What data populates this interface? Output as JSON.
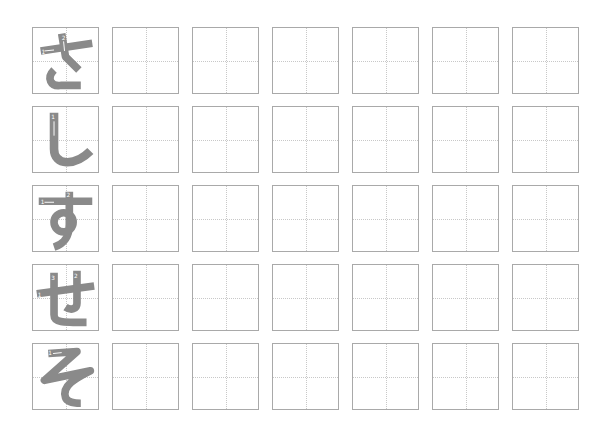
{
  "worksheet": {
    "title": "Hiragana writing practice",
    "stroke_color": "#8a8a8a",
    "grid_line_color": "#c8c8c8",
    "box_border_color": "#a9a9a9",
    "practice_boxes_per_row": 6,
    "rows": [
      {
        "character": "さ",
        "romaji": "sa",
        "stroke_labels": [
          "1",
          "2",
          "3"
        ]
      },
      {
        "character": "し",
        "romaji": "shi",
        "stroke_labels": [
          "1"
        ]
      },
      {
        "character": "す",
        "romaji": "su",
        "stroke_labels": [
          "1",
          "2"
        ]
      },
      {
        "character": "せ",
        "romaji": "se",
        "stroke_labels": [
          "1",
          "2",
          "3"
        ]
      },
      {
        "character": "そ",
        "romaji": "so",
        "stroke_labels": [
          "1"
        ]
      }
    ]
  }
}
